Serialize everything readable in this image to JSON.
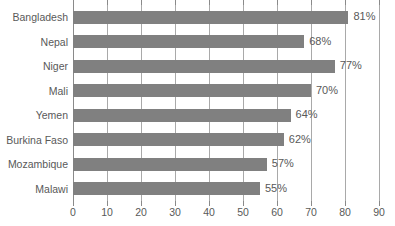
{
  "chart_data": {
    "type": "bar",
    "orientation": "horizontal",
    "title": "",
    "subtitle": "",
    "xlabel": "",
    "ylabel": "",
    "xlim": [
      0,
      90
    ],
    "xticks": [
      0,
      10,
      20,
      30,
      40,
      50,
      60,
      70,
      80,
      90
    ],
    "xtick_labels": [
      "0",
      "10",
      "20",
      "30",
      "40",
      "50",
      "60",
      "70",
      "80",
      "90"
    ],
    "grid": "vertical",
    "legend": "none",
    "value_suffix": "%",
    "categories": [
      "Bangladesh",
      "Nepal",
      "Niger",
      "Mali",
      "Yemen",
      "Burkina Faso",
      "Mozambique",
      "Malawi"
    ],
    "values": [
      81,
      68,
      77,
      70,
      64,
      62,
      57,
      55
    ],
    "data_labels": [
      "81%",
      "68%",
      "77%",
      "70%",
      "64%",
      "62%",
      "57%",
      "55%"
    ],
    "colors": {
      "bar": "#808080",
      "gridline": "#a9a9a9",
      "axis": "#8a8a8a",
      "text": "#595959",
      "background": "#ffffff"
    }
  }
}
